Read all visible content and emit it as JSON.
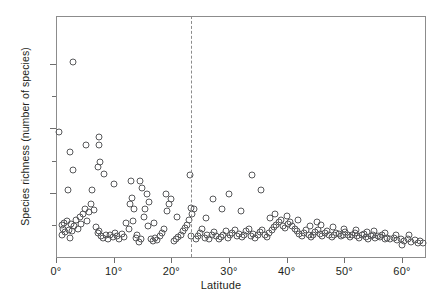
{
  "chart_data": {
    "type": "scatter",
    "title": "",
    "xlabel": "Latitude",
    "ylabel": "Species richness (number of species)",
    "xlim": [
      0,
      64
    ],
    "ylim": [
      0,
      1500
    ],
    "grid": false,
    "legend": null,
    "xticks": [
      {
        "value": 0,
        "label": "0°"
      },
      {
        "value": 10,
        "label": "10°"
      },
      {
        "value": 20,
        "label": "20°"
      },
      {
        "value": 30,
        "label": "30°"
      },
      {
        "value": 40,
        "label": "40°"
      },
      {
        "value": 50,
        "label": "50°"
      },
      {
        "value": 60,
        "label": "60°"
      }
    ],
    "yticks": [
      {
        "value": 200,
        "label": "",
        "major": false
      },
      {
        "value": 400,
        "label": "400",
        "major": true
      },
      {
        "value": 600,
        "label": "",
        "major": false
      },
      {
        "value": 800,
        "label": "800",
        "major": true
      },
      {
        "value": 1000,
        "label": "",
        "major": false
      },
      {
        "value": 1200,
        "label": "1200",
        "major": true
      }
    ],
    "annotations": [
      {
        "kind": "vline",
        "x": 23.5,
        "style": "dashed",
        "color": "#8c8c8c",
        "label": ""
      }
    ],
    "marker": {
      "shape": "open-circle",
      "size_px": 7,
      "edge_color": "#58595b",
      "fill": "none"
    },
    "points": [
      [
        1.0,
        140
      ],
      [
        1.2,
        175
      ],
      [
        1.4,
        210
      ],
      [
        1.6,
        155
      ],
      [
        1.9,
        225
      ],
      [
        2.2,
        170
      ],
      [
        2.4,
        120
      ],
      [
        2.6,
        205
      ],
      [
        2.8,
        160
      ],
      [
        3.0,
        1215
      ],
      [
        0.6,
        780
      ],
      [
        1.1,
        200
      ],
      [
        2.0,
        415
      ],
      [
        3.2,
        190
      ],
      [
        3.5,
        230
      ],
      [
        3.8,
        175
      ],
      [
        4.1,
        250
      ],
      [
        4.4,
        205
      ],
      [
        4.7,
        265
      ],
      [
        5.0,
        300
      ],
      [
        2.5,
        655
      ],
      [
        3.0,
        540
      ],
      [
        5.4,
        225
      ],
      [
        5.7,
        280
      ],
      [
        6.0,
        330
      ],
      [
        6.3,
        415
      ],
      [
        6.6,
        295
      ],
      [
        5.2,
        700
      ],
      [
        6.9,
        185
      ],
      [
        7.2,
        150
      ],
      [
        7.5,
        160
      ],
      [
        7.8,
        130
      ],
      [
        7.2,
        560
      ],
      [
        7.6,
        590
      ],
      [
        7.4,
        745
      ],
      [
        7.4,
        700
      ],
      [
        8.2,
        120
      ],
      [
        8.6,
        140
      ],
      [
        9.0,
        115
      ],
      [
        9.4,
        135
      ],
      [
        8.4,
        515
      ],
      [
        9.8,
        125
      ],
      [
        10.2,
        150
      ],
      [
        10.6,
        130
      ],
      [
        11.0,
        110
      ],
      [
        11.4,
        145
      ],
      [
        11.8,
        125
      ],
      [
        10.0,
        455
      ],
      [
        12.2,
        210
      ],
      [
        12.6,
        175
      ],
      [
        12.9,
        330
      ],
      [
        13.2,
        370
      ],
      [
        13.5,
        300
      ],
      [
        13.0,
        470
      ],
      [
        13.8,
        120
      ],
      [
        14.1,
        140
      ],
      [
        14.4,
        95
      ],
      [
        13.4,
        225
      ],
      [
        14.8,
        110
      ],
      [
        15.2,
        250
      ],
      [
        15.5,
        300
      ],
      [
        15.8,
        390
      ],
      [
        16.1,
        345
      ],
      [
        15.0,
        430
      ],
      [
        14.6,
        470
      ],
      [
        16.4,
        115
      ],
      [
        16.8,
        100
      ],
      [
        17.2,
        120
      ],
      [
        17.6,
        105
      ],
      [
        18.0,
        130
      ],
      [
        16.0,
        195
      ],
      [
        17.0,
        210
      ],
      [
        18.4,
        150
      ],
      [
        18.8,
        175
      ],
      [
        19.2,
        285
      ],
      [
        19.6,
        330
      ],
      [
        20.0,
        360
      ],
      [
        19.0,
        395
      ],
      [
        20.4,
        100
      ],
      [
        20.8,
        115
      ],
      [
        21.2,
        125
      ],
      [
        21.6,
        140
      ],
      [
        22.0,
        160
      ],
      [
        22.4,
        180
      ],
      [
        22.8,
        200
      ],
      [
        21.0,
        250
      ],
      [
        23.0,
        230
      ],
      [
        23.3,
        510
      ],
      [
        23.5,
        305
      ],
      [
        23.6,
        265
      ],
      [
        23.4,
        130
      ],
      [
        24.2,
        110
      ],
      [
        24.6,
        130
      ],
      [
        25.0,
        150
      ],
      [
        25.4,
        175
      ],
      [
        24.0,
        300
      ],
      [
        25.8,
        120
      ],
      [
        26.2,
        140
      ],
      [
        26.6,
        115
      ],
      [
        27.0,
        135
      ],
      [
        26.0,
        245
      ],
      [
        27.4,
        155
      ],
      [
        27.8,
        130
      ],
      [
        28.2,
        110
      ],
      [
        28.6,
        125
      ],
      [
        27.2,
        360
      ],
      [
        29.0,
        140
      ],
      [
        29.4,
        160
      ],
      [
        29.8,
        120
      ],
      [
        30.2,
        135
      ],
      [
        28.8,
        300
      ],
      [
        30.6,
        150
      ],
      [
        31.0,
        170
      ],
      [
        31.4,
        130
      ],
      [
        31.8,
        145
      ],
      [
        30.0,
        395
      ],
      [
        32.2,
        125
      ],
      [
        32.6,
        140
      ],
      [
        33.0,
        160
      ],
      [
        33.4,
        175
      ],
      [
        32.0,
        285
      ],
      [
        33.8,
        130
      ],
      [
        34.2,
        145
      ],
      [
        34.6,
        120
      ],
      [
        35.0,
        135
      ],
      [
        34.0,
        510
      ],
      [
        35.4,
        155
      ],
      [
        35.8,
        170
      ],
      [
        36.2,
        140
      ],
      [
        36.6,
        125
      ],
      [
        35.6,
        420
      ],
      [
        37.0,
        150
      ],
      [
        37.4,
        165
      ],
      [
        37.8,
        185
      ],
      [
        38.2,
        200
      ],
      [
        37.2,
        245
      ],
      [
        38.6,
        215
      ],
      [
        39.0,
        230
      ],
      [
        39.4,
        195
      ],
      [
        39.8,
        180
      ],
      [
        38.0,
        270
      ],
      [
        40.2,
        205
      ],
      [
        40.6,
        220
      ],
      [
        41.0,
        190
      ],
      [
        41.4,
        175
      ],
      [
        40.0,
        255
      ],
      [
        41.8,
        160
      ],
      [
        42.2,
        145
      ],
      [
        42.6,
        130
      ],
      [
        43.0,
        150
      ],
      [
        42.0,
        230
      ],
      [
        43.4,
        165
      ],
      [
        43.8,
        140
      ],
      [
        44.2,
        125
      ],
      [
        44.6,
        135
      ],
      [
        44.0,
        190
      ],
      [
        45.0,
        155
      ],
      [
        45.4,
        170
      ],
      [
        45.8,
        145
      ],
      [
        46.2,
        130
      ],
      [
        45.2,
        215
      ],
      [
        46.6,
        150
      ],
      [
        47.0,
        160
      ],
      [
        47.4,
        140
      ],
      [
        47.8,
        125
      ],
      [
        46.0,
        200
      ],
      [
        48.2,
        135
      ],
      [
        48.6,
        150
      ],
      [
        49.0,
        145
      ],
      [
        49.4,
        130
      ],
      [
        48.0,
        185
      ],
      [
        49.8,
        140
      ],
      [
        50.2,
        155
      ],
      [
        50.6,
        135
      ],
      [
        51.0,
        125
      ],
      [
        50.0,
        175
      ],
      [
        51.4,
        140
      ],
      [
        51.8,
        150
      ],
      [
        52.2,
        130
      ],
      [
        52.6,
        120
      ],
      [
        52.0,
        165
      ],
      [
        53.0,
        135
      ],
      [
        53.4,
        145
      ],
      [
        53.8,
        125
      ],
      [
        54.2,
        115
      ],
      [
        54.0,
        155
      ],
      [
        54.6,
        130
      ],
      [
        55.0,
        140
      ],
      [
        55.4,
        120
      ],
      [
        55.8,
        130
      ],
      [
        55.2,
        160
      ],
      [
        56.2,
        125
      ],
      [
        56.6,
        135
      ],
      [
        57.0,
        115
      ],
      [
        57.4,
        120
      ],
      [
        57.0,
        150
      ],
      [
        58.0,
        110
      ],
      [
        58.6,
        120
      ],
      [
        59.2,
        105
      ],
      [
        59.8,
        115
      ],
      [
        59.0,
        140
      ],
      [
        60.4,
        100
      ],
      [
        61.0,
        110
      ],
      [
        61.6,
        95
      ],
      [
        62.2,
        105
      ],
      [
        61.2,
        135
      ],
      [
        62.8,
        90
      ],
      [
        63.2,
        100
      ],
      [
        63.6,
        85
      ],
      [
        60.0,
        75
      ]
    ]
  }
}
